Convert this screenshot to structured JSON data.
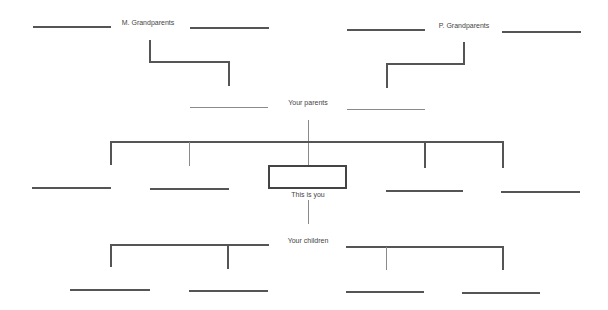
{
  "diagram": {
    "type": "family-tree-template",
    "labels": {
      "maternal_grandparents": "M. Grandparents",
      "paternal_grandparents": "P. Grandparents",
      "parents": "Your parents",
      "self": "This is you",
      "children": "Your children"
    },
    "blanks": {
      "maternal_grandparents": 2,
      "paternal_grandparents": 2,
      "parents": 2,
      "siblings": 4,
      "children": 4
    },
    "colors": {
      "line": "#555555",
      "text": "#444444",
      "background": "#ffffff"
    }
  }
}
